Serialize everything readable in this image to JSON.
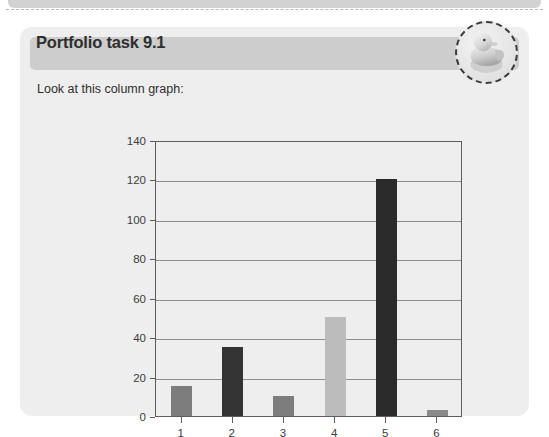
{
  "page": {
    "background_color": "#ffffff",
    "previous_box": {
      "fill": "#d2d2d2"
    }
  },
  "card": {
    "background_color": "#eeeeee",
    "header_color": "#cdcdcd",
    "title": "Portfolio task 9.1",
    "prompt": "Look at this column graph:"
  },
  "badge": {
    "icon": "rubber-duck-icon",
    "border_style": "dashed",
    "border_color": "#3a3a3a"
  },
  "chart_data": {
    "type": "bar",
    "title": "",
    "xlabel": "",
    "ylabel": "",
    "categories": [
      "1",
      "2",
      "3",
      "4",
      "5",
      "6"
    ],
    "values": [
      15,
      35,
      10,
      50,
      120,
      3
    ],
    "bar_colors": [
      "#7d7d7d",
      "#333333",
      "#7d7d7d",
      "#bcbcbc",
      "#2b2b2b",
      "#8a8a8a"
    ],
    "ylim": [
      0,
      140
    ],
    "yticks": [
      0,
      20,
      40,
      60,
      80,
      100,
      120,
      140
    ],
    "ytick_labels": [
      "0",
      "20",
      "40",
      "60",
      "80",
      "100",
      "120",
      "140"
    ],
    "grid": true,
    "grid_axis": "y",
    "grid_color": "#8e8e8e",
    "axis_color": "#5d5d5d",
    "legend": null,
    "legend_position": "none"
  }
}
